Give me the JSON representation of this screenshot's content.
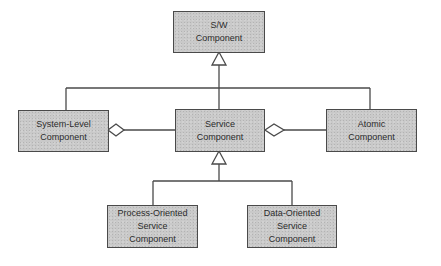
{
  "diagram": {
    "type": "uml-class-hierarchy",
    "nodes": [
      {
        "id": "sw",
        "lines": [
          "S/W",
          "Component"
        ]
      },
      {
        "id": "system",
        "lines": [
          "System-Level",
          "Component"
        ]
      },
      {
        "id": "service",
        "lines": [
          "Service",
          "Component"
        ]
      },
      {
        "id": "atomic",
        "lines": [
          "Atomic",
          "Component"
        ]
      },
      {
        "id": "process",
        "lines": [
          "Process-Oriented",
          "Service",
          "Component"
        ]
      },
      {
        "id": "data",
        "lines": [
          "Data-Oriented",
          "Service",
          "Component"
        ]
      }
    ],
    "edges": [
      {
        "from": "system",
        "to": "sw",
        "kind": "generalization"
      },
      {
        "from": "service",
        "to": "sw",
        "kind": "generalization"
      },
      {
        "from": "atomic",
        "to": "sw",
        "kind": "generalization"
      },
      {
        "from": "service",
        "to": "system",
        "kind": "aggregation",
        "diamond_at": "system"
      },
      {
        "from": "atomic",
        "to": "service",
        "kind": "aggregation",
        "diamond_at": "service"
      },
      {
        "from": "process",
        "to": "service",
        "kind": "generalization"
      },
      {
        "from": "data",
        "to": "service",
        "kind": "generalization"
      }
    ],
    "colors": {
      "box_fill": "#c9c9c9",
      "stroke": "#4a4a4a",
      "text": "#2b2b2b"
    }
  }
}
